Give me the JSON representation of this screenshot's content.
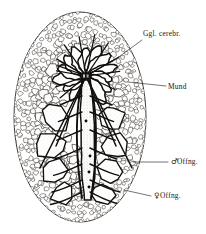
{
  "figure": {
    "background_color": "#ffffff",
    "ink_color": "#17130f",
    "body": {
      "shape": "oval",
      "center_x": 80,
      "center_y": 117,
      "radius_x": 66,
      "radius_y": 105
    }
  },
  "labels": {
    "ganglion": {
      "text": "Ggl. cerebr.",
      "x": 143,
      "y": 36,
      "symbol": ""
    },
    "mouth": {
      "text": "Mund",
      "x": 168,
      "y": 89,
      "symbol": ""
    },
    "male_opening": {
      "text": "Offng.",
      "x": 171,
      "y": 164,
      "symbol": "♂"
    },
    "female_opening": {
      "text": "Offng.",
      "x": 154,
      "y": 198,
      "symbol": "♀"
    }
  },
  "leaders": [
    {
      "name": "leader-ganglion",
      "x1": 142,
      "y1": 40,
      "x2": 112,
      "y2": 62
    },
    {
      "name": "leader-mund",
      "x1": 166,
      "y1": 86,
      "x2": 128,
      "y2": 82
    },
    {
      "name": "leader-male",
      "x1": 168,
      "y1": 162,
      "x2": 133,
      "y2": 162
    },
    {
      "name": "leader-female",
      "x1": 151,
      "y1": 196,
      "x2": 124,
      "y2": 190
    }
  ],
  "midline_dots": [
    {
      "x": 86,
      "y": 121
    },
    {
      "x": 90,
      "y": 156
    },
    {
      "x": 89,
      "y": 172
    },
    {
      "x": 89,
      "y": 187
    }
  ],
  "central_ganglion": {
    "x": 86,
    "y": 76,
    "width": 11,
    "height": 6
  },
  "annotations": {
    "style": "engraving",
    "language": "de"
  }
}
